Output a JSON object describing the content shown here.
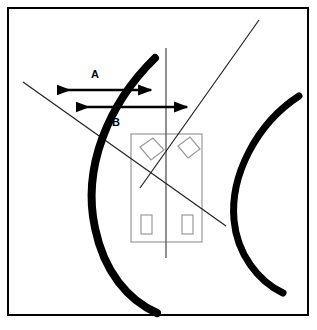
{
  "figure": {
    "canvas": {
      "width": 317,
      "height": 330,
      "background": "#ffffff"
    },
    "frame": {
      "name": "outer-border",
      "x": 8,
      "y": 8,
      "width": 300,
      "height": 307,
      "stroke": "#000000",
      "stroke_width": 2,
      "fill": "none"
    },
    "labels": [
      {
        "id": "A",
        "text": "A",
        "x": 95,
        "y": 78
      },
      {
        "id": "B",
        "text": "B",
        "x": 116,
        "y": 126
      }
    ],
    "dimension_arrows": [
      {
        "id": "A",
        "name": "dimension-arrow-a",
        "x1": 58,
        "x2": 151,
        "y": 90,
        "stroke": "#000000",
        "stroke_width": 2.4,
        "double_headed": true
      },
      {
        "id": "B",
        "name": "dimension-arrow-b",
        "x1": 77,
        "x2": 187,
        "y": 107,
        "stroke": "#000000",
        "stroke_width": 2.4,
        "double_headed": true
      }
    ],
    "center_line": {
      "name": "vertical-center-line",
      "x1": 166,
      "y1": 48,
      "x2": 166,
      "y2": 258,
      "stroke": "#555555",
      "stroke_width": 1.3
    },
    "diagonals": [
      {
        "name": "descending-diagonal",
        "x1": 23,
        "y1": 82,
        "x2": 226,
        "y2": 226,
        "stroke": "#222222",
        "stroke_width": 1.2
      },
      {
        "name": "ascending-diagonal",
        "x1": 140,
        "y1": 188,
        "x2": 259,
        "y2": 20,
        "stroke": "#222222",
        "stroke_width": 1.2
      }
    ],
    "component_outline": {
      "name": "component-body-rectangle",
      "x": 131,
      "y": 134,
      "width": 71,
      "height": 108,
      "stroke": "#999999",
      "stroke_width": 1.2,
      "fill": "none"
    },
    "component_inner_shapes": [
      {
        "name": "tilted-panel-left",
        "type": "parallelogram",
        "points": "140,147 153,138 164,150 151,160",
        "stroke": "#999999",
        "stroke_width": 1.2
      },
      {
        "name": "tilted-panel-right",
        "type": "parallelogram",
        "points": "178,146 190,137 200,149 188,158",
        "stroke": "#999999",
        "stroke_width": 1.2
      },
      {
        "name": "lower-slot-left",
        "type": "rect",
        "x": 141,
        "y": 215,
        "width": 11,
        "height": 19,
        "stroke": "#999999",
        "stroke_width": 1.2
      },
      {
        "name": "lower-slot-right",
        "type": "rect",
        "x": 182,
        "y": 215,
        "width": 11,
        "height": 19,
        "stroke": "#999999",
        "stroke_width": 1.2
      }
    ],
    "arcs": [
      {
        "name": "left-thick-arc",
        "path": "M 155 58 C 108 104, 82 168, 95 228 C 104 272, 128 300, 157 313",
        "stroke": "#000000",
        "stroke_width": 8,
        "fill": "none"
      },
      {
        "name": "right-thick-arc",
        "path": "M 299 96 C 256 124, 230 176, 234 220 C 237 254, 258 281, 283 293",
        "stroke": "#000000",
        "stroke_width": 7,
        "fill": "none"
      }
    ]
  }
}
